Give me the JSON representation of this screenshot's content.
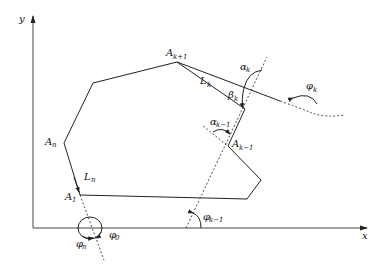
{
  "figure": {
    "type": "geometric-diagram",
    "axes": {
      "x_label": "x",
      "y_label": "y"
    },
    "labels": {
      "A_k_plus_1": {
        "base": "A",
        "sub": "k+1"
      },
      "L_k": {
        "base": "L",
        "sub": "k"
      },
      "alpha_k": {
        "base": "α",
        "sub": "k"
      },
      "beta_k": {
        "base": "β",
        "sub": "k"
      },
      "phi_k": {
        "base": "φ",
        "sub": "k"
      },
      "alpha_k_minus_1": {
        "base": "α",
        "sub": "k−1"
      },
      "A_k_minus_1": {
        "base": "A",
        "sub": "k−1"
      },
      "A_n": {
        "base": "A",
        "sub": "n"
      },
      "L_n": {
        "base": "L",
        "sub": "n"
      },
      "A_1": {
        "base": "A",
        "sub": "1"
      },
      "phi_k_minus_1": {
        "base": "φ",
        "sub": "k−1"
      },
      "phi_n": {
        "base": "φ",
        "sub": "n"
      },
      "phi_0": {
        "base": "φ",
        "sub": "0"
      }
    },
    "polygon_vertices": [
      [
        80,
        195
      ],
      [
        247,
        199
      ],
      [
        261,
        180
      ],
      [
        228,
        146
      ],
      [
        245,
        109
      ],
      [
        177,
        62
      ],
      [
        93,
        83
      ],
      [
        64,
        143
      ]
    ],
    "colors": {
      "stroke": "#222222",
      "background": "#ffffff"
    }
  }
}
